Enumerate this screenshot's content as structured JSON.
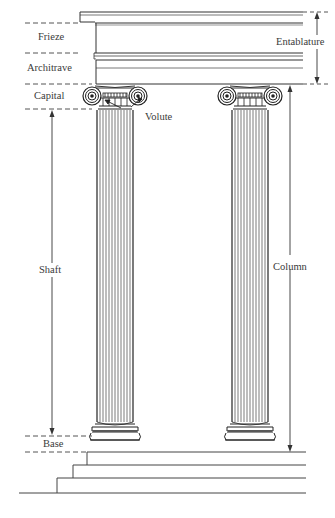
{
  "diagram": {
    "colors": {
      "line": "#333333",
      "dash": "#555555",
      "background": "#ffffff"
    },
    "labels": {
      "frieze": "Frieze",
      "architrave": "Architrave",
      "capital": "Capital",
      "volute": "Volute",
      "shaft": "Shaft",
      "base": "Base",
      "entablature": "Entablature",
      "column": "Column"
    },
    "columns": [
      {
        "name": "left-column",
        "x_left": 97,
        "x_right": 133
      },
      {
        "name": "right-column",
        "x_left": 232,
        "x_right": 268
      }
    ],
    "steps_count": 3
  }
}
